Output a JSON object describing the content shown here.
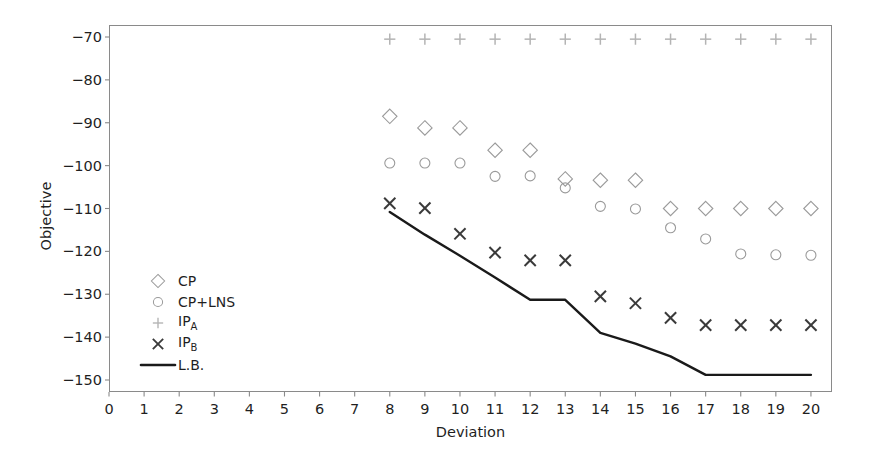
{
  "chart_data": {
    "type": "scatter",
    "title": "",
    "xlabel": "Deviation",
    "ylabel": "Objective",
    "xlim": [
      0,
      20.6
    ],
    "ylim": [
      -152.8,
      -67.2
    ],
    "xticks": [
      0,
      1,
      2,
      3,
      4,
      5,
      6,
      7,
      8,
      9,
      10,
      11,
      12,
      13,
      14,
      15,
      16,
      17,
      18,
      19,
      20
    ],
    "yticks": [
      -70,
      -80,
      -90,
      -100,
      -110,
      -120,
      -130,
      -140,
      -150
    ],
    "xtick_labels": [
      "0",
      "1",
      "2",
      "3",
      "4",
      "5",
      "6",
      "7",
      "8",
      "9",
      "10",
      "11",
      "12",
      "13",
      "14",
      "15",
      "16",
      "17",
      "18",
      "19",
      "20"
    ],
    "ytick_labels": [
      "−70",
      "−80",
      "−90",
      "−100",
      "−110",
      "−120",
      "−130",
      "−140",
      "−150"
    ],
    "grid": false,
    "legend_position": "center-left",
    "series": [
      {
        "name": "CP",
        "marker": "diamond",
        "color": "#9a9a9a",
        "x": [
          8,
          9,
          10,
          11,
          12,
          13,
          14,
          15,
          16,
          17,
          18,
          19,
          20
        ],
        "values": [
          -88.5,
          -91.2,
          -91.2,
          -96.4,
          -96.4,
          -103.1,
          -103.4,
          -103.4,
          -110.0,
          -110.0,
          -110.0,
          -110.0,
          -110.0
        ]
      },
      {
        "name": "CP+LNS",
        "marker": "circle",
        "color": "#9a9a9a",
        "x": [
          8,
          9,
          10,
          11,
          12,
          13,
          14,
          15,
          16,
          17,
          18,
          19,
          20
        ],
        "values": [
          -99.4,
          -99.4,
          -99.4,
          -102.5,
          -102.4,
          -105.2,
          -109.5,
          -110.1,
          -114.5,
          -117.1,
          -120.6,
          -120.8,
          -120.9
        ]
      },
      {
        "name": "IP_A",
        "marker": "plus",
        "color": "#b4b4b4",
        "x": [
          8,
          9,
          10,
          11,
          12,
          13,
          14,
          15,
          16,
          17,
          18,
          19,
          20
        ],
        "values": [
          -70.5,
          -70.5,
          -70.5,
          -70.5,
          -70.5,
          -70.5,
          -70.5,
          -70.5,
          -70.5,
          -70.5,
          -70.5,
          -70.5,
          -70.5
        ]
      },
      {
        "name": "IP_B",
        "marker": "x",
        "color": "#3a3a3a",
        "x": [
          8,
          9,
          10,
          11,
          12,
          13,
          14,
          15,
          16,
          17,
          18,
          19,
          20
        ],
        "values": [
          -108.8,
          -109.9,
          -115.9,
          -120.3,
          -122.1,
          -122.1,
          -130.5,
          -132.1,
          -135.5,
          -137.2,
          -137.2,
          -137.2,
          -137.2
        ]
      },
      {
        "name": "L.B.",
        "marker": "line",
        "color": "#1a1a1a",
        "x": [
          8,
          9,
          10,
          11,
          12,
          13,
          14,
          15,
          16,
          17,
          18,
          19,
          20
        ],
        "values": [
          -110.8,
          -116.1,
          -121.0,
          -126.1,
          -131.3,
          -131.3,
          -139.0,
          -141.5,
          -144.5,
          -148.8,
          -148.8,
          -148.8,
          -148.8
        ]
      }
    ]
  },
  "axes": {
    "ylabel": "Objective",
    "xlabel": "Deviation"
  },
  "legend": {
    "items": [
      {
        "label": "CP",
        "marker": "diamond-icon"
      },
      {
        "label": "CP+LNS",
        "marker": "circle-icon"
      },
      {
        "label": "IP",
        "sub": "A",
        "marker": "plus-icon"
      },
      {
        "label": "IP",
        "sub": "B",
        "marker": "x-icon"
      },
      {
        "label": "L.B.",
        "marker": "line-icon"
      }
    ]
  }
}
